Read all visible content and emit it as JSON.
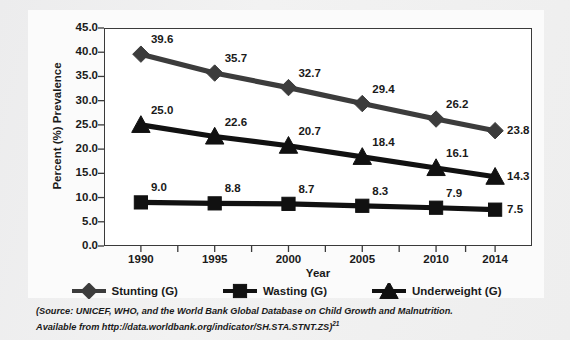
{
  "chart_data": {
    "type": "line",
    "title": "",
    "xlabel": "Year",
    "ylabel": "Percent (%) Prevalence",
    "categories": [
      "1990",
      "1995",
      "2000",
      "2005",
      "2010",
      "2014"
    ],
    "x": [
      1990,
      1995,
      2000,
      2005,
      2010,
      2014
    ],
    "xlim": [
      1987.5,
      2016.5
    ],
    "ylim": [
      0,
      45
    ],
    "yticks": [
      "0.0",
      "5.0",
      "10.0",
      "15.0",
      "20.0",
      "25.0",
      "30.0",
      "35.0",
      "40.0",
      "45.0"
    ],
    "grid": false,
    "legend_position": "bottom",
    "series": [
      {
        "name": "Stunting (G)",
        "marker": "diamond",
        "color": "#3c3c3c",
        "values": [
          39.6,
          35.7,
          32.7,
          29.4,
          26.2,
          23.8
        ],
        "labels": [
          "39.6",
          "35.7",
          "32.7",
          "29.4",
          "26.2",
          "23.8"
        ]
      },
      {
        "name": "Wasting (G)",
        "marker": "square",
        "color": "#111111",
        "values": [
          9.0,
          8.8,
          8.7,
          8.3,
          7.9,
          7.5
        ],
        "labels": [
          "9.0",
          "8.8",
          "8.7",
          "8.3",
          "7.9",
          "7.5"
        ]
      },
      {
        "name": "Underweight (G)",
        "marker": "triangle",
        "color": "#111111",
        "values": [
          25.0,
          22.6,
          20.7,
          18.4,
          16.1,
          14.3
        ],
        "labels": [
          "25.0",
          "22.6",
          "20.7",
          "18.4",
          "16.1",
          "14.3"
        ]
      }
    ]
  },
  "legend": {
    "items": [
      {
        "label": "Stunting (G)",
        "marker": "diamond"
      },
      {
        "label": "Wasting (G)",
        "marker": "square"
      },
      {
        "label": "Underweight (G)",
        "marker": "triangle"
      }
    ]
  },
  "source_note": {
    "line1": "(Source: UNICEF, WHO, and the World Bank Global Database on Child Growth and Malnutrition.",
    "line2_prefix": "Available from http://data.worldbank.org/indicator/SH.STA.STNT.ZS)",
    "line2_superscript": "21"
  }
}
